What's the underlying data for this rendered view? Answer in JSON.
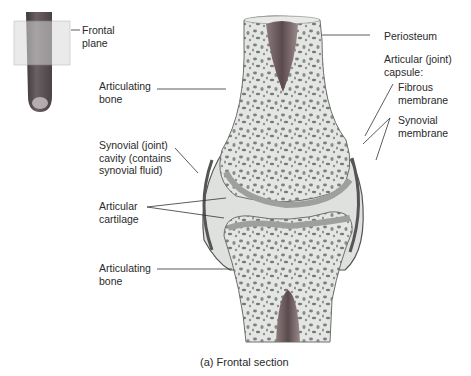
{
  "figure": {
    "caption": "(a) Frontal section",
    "inset_label": "Frontal\nplane"
  },
  "labels": {
    "articulating_bone_top": "Articulating\nbone",
    "synovial_cavity": "Synovial (joint)\ncavity (contains\nsynovial fluid)",
    "articular_cartilage": "Articular\ncartilage",
    "articulating_bone_bottom": "Articulating\nbone",
    "periosteum": "Periosteum",
    "articular_capsule": "Articular (joint)\ncapsule:",
    "fibrous_membrane": "Fibrous\nmembrane",
    "synovial_membrane": "Synovial\nmembrane"
  },
  "colors": {
    "bone_fill": "#e4e6e4",
    "spongy_dots": "#7a7c7a",
    "cartilage": "#b9bcb9",
    "marrow": "#6e5a5c",
    "finger": "#5b5155"
  }
}
